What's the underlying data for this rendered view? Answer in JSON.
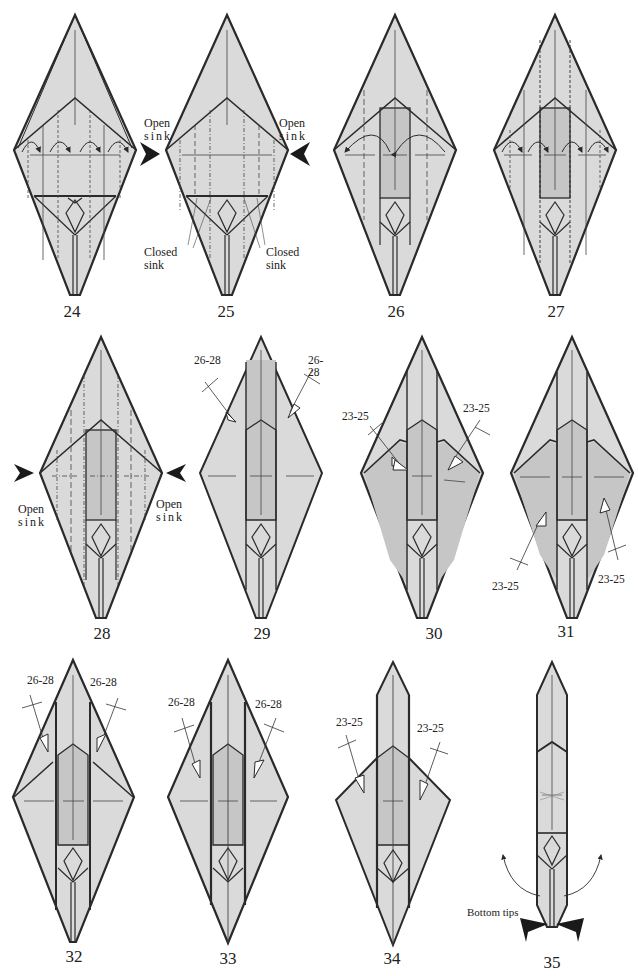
{
  "colors": {
    "paper_light": "#dadada",
    "paper_dark": "#c6c6c6",
    "line": "#2a2a2a",
    "background": "#ffffff"
  },
  "steps": [
    {
      "number": "24",
      "labels": []
    },
    {
      "number": "25",
      "labels": [
        "Open",
        "sink",
        "Open",
        "sink",
        "Closed",
        "sink",
        "Closed",
        "sink"
      ]
    },
    {
      "number": "26",
      "labels": []
    },
    {
      "number": "27",
      "labels": []
    },
    {
      "number": "28",
      "labels": [
        "Open",
        "sink",
        "Open",
        "sink"
      ]
    },
    {
      "number": "29",
      "refs": [
        "26-28",
        "26-28"
      ]
    },
    {
      "number": "30",
      "refs": [
        "23-25",
        "23-25"
      ]
    },
    {
      "number": "31",
      "refs": [
        "23-25",
        "23-25"
      ]
    },
    {
      "number": "32",
      "refs": [
        "26-28",
        "26-28"
      ]
    },
    {
      "number": "33",
      "refs": [
        "26-28",
        "26-28"
      ]
    },
    {
      "number": "34",
      "refs": [
        "23-25",
        "23-25"
      ]
    },
    {
      "number": "35",
      "labels": [
        "Bottom tips"
      ]
    }
  ],
  "text": {
    "open": "Open",
    "sink": "sink",
    "closed": "Closed",
    "r2628": "26-28",
    "r2325": "23-25",
    "bottom_tips": "Bottom tips"
  }
}
